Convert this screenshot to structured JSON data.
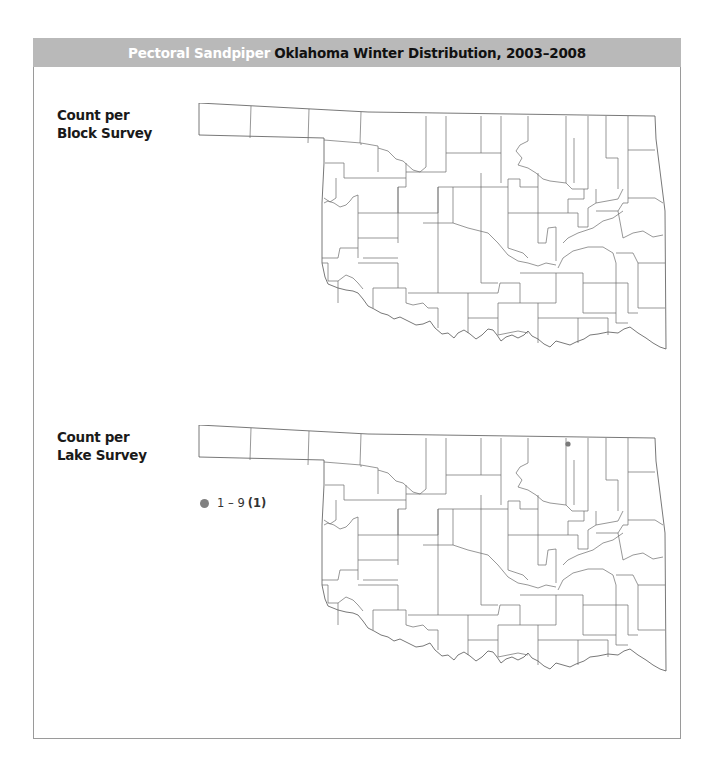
{
  "header": {
    "species": "Pectoral Sandpiper",
    "title": "Oklahoma Winter Distribution, 2003–2008",
    "bar_color": "#b9b9b9"
  },
  "panels": [
    {
      "label_line1": "Count per",
      "label_line2": "Block Survey",
      "map": "Oklahoma counties",
      "points": []
    },
    {
      "label_line1": "Count per",
      "label_line2": "Lake Survey",
      "map": "Oklahoma counties",
      "legend": [
        {
          "range": "1 – 9",
          "count": "(1)",
          "color": "#808080"
        }
      ],
      "points": [
        {
          "approx_location": "north-central Oklahoma near Kansas border (Kay/Osage area)",
          "category": "1 – 9",
          "color": "#808080"
        }
      ]
    }
  ]
}
